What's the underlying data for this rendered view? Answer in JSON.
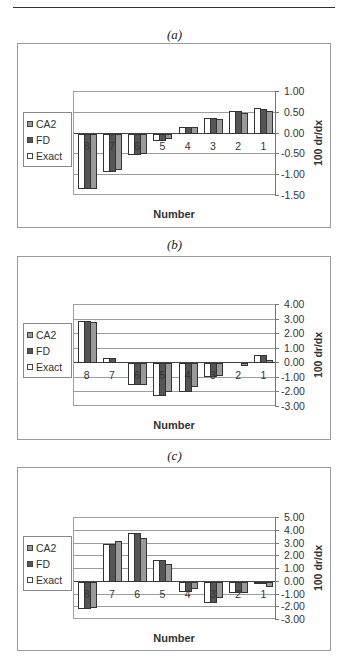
{
  "panels": [
    {
      "label": "(a)"
    },
    {
      "label": "(b)"
    },
    {
      "label": "(c)"
    }
  ],
  "legend": [
    {
      "name": "CA2",
      "color": "#9a9a9a"
    },
    {
      "name": "FD",
      "color": "#555555"
    },
    {
      "name": "Exact",
      "color": "#ffffff"
    }
  ],
  "chart_data": [
    {
      "type": "bar",
      "title": "(a)",
      "xlabel": "Number",
      "ylabel": "100 dr/dx",
      "categories": [
        "8",
        "7",
        "6",
        "5",
        "4",
        "3",
        "2",
        "1"
      ],
      "ylim": [
        -1.5,
        1.0
      ],
      "yticks": [
        "1.00",
        "0.50",
        "0.00",
        "-0.50",
        "-1.00",
        "-1.50"
      ],
      "grid": true,
      "legend_position": "left",
      "series": [
        {
          "name": "Exact",
          "values": [
            -1.32,
            -0.93,
            -0.52,
            -0.18,
            0.15,
            0.38,
            0.55,
            0.62
          ]
        },
        {
          "name": "FD",
          "values": [
            -1.32,
            -0.93,
            -0.52,
            -0.18,
            0.15,
            0.38,
            0.55,
            0.6
          ]
        },
        {
          "name": "CA2",
          "values": [
            -1.32,
            -0.87,
            -0.48,
            -0.12,
            0.15,
            0.35,
            0.5,
            0.55
          ]
        }
      ]
    },
    {
      "type": "bar",
      "title": "(b)",
      "xlabel": "Number",
      "ylabel": "100 dr/dx",
      "categories": [
        "8",
        "7",
        "6",
        "5",
        "4",
        "3",
        "2",
        "1"
      ],
      "ylim": [
        -3.0,
        4.0
      ],
      "yticks": [
        "4.00",
        "3.00",
        "2.00",
        "1.00",
        "0.00",
        "-1.00",
        "-2.00",
        "-3.00"
      ],
      "grid": true,
      "legend_position": "left",
      "series": [
        {
          "name": "Exact",
          "values": [
            2.9,
            0.35,
            -1.5,
            -2.25,
            -1.95,
            -0.95,
            0.0,
            0.6
          ]
        },
        {
          "name": "FD",
          "values": [
            2.9,
            0.35,
            -1.5,
            -2.25,
            -1.95,
            -0.95,
            0.0,
            0.6
          ]
        },
        {
          "name": "CA2",
          "values": [
            2.85,
            0.0,
            -1.5,
            -1.95,
            -1.6,
            -0.9,
            -0.18,
            0.22
          ]
        }
      ]
    },
    {
      "type": "bar",
      "title": "(c)",
      "xlabel": "Number",
      "ylabel": "100 dr/dx",
      "categories": [
        "8",
        "7",
        "6",
        "5",
        "4",
        "3",
        "2",
        "1"
      ],
      "ylim": [
        -3.0,
        5.0
      ],
      "yticks": [
        "5.00",
        "4.00",
        "3.00",
        "2.00",
        "1.00",
        "0.00",
        "-1.00",
        "-2.00",
        "-3.00"
      ],
      "grid": true,
      "legend_position": "left",
      "series": [
        {
          "name": "Exact",
          "values": [
            -2.1,
            3.0,
            3.85,
            1.7,
            -0.8,
            -1.7,
            -0.9,
            -0.05
          ]
        },
        {
          "name": "FD",
          "values": [
            -2.1,
            3.0,
            3.85,
            1.7,
            -0.8,
            -1.7,
            -0.9,
            -0.05
          ]
        },
        {
          "name": "CA2",
          "values": [
            -2.05,
            3.2,
            3.4,
            1.4,
            -0.55,
            -1.25,
            -0.9,
            -0.4
          ]
        }
      ]
    }
  ]
}
